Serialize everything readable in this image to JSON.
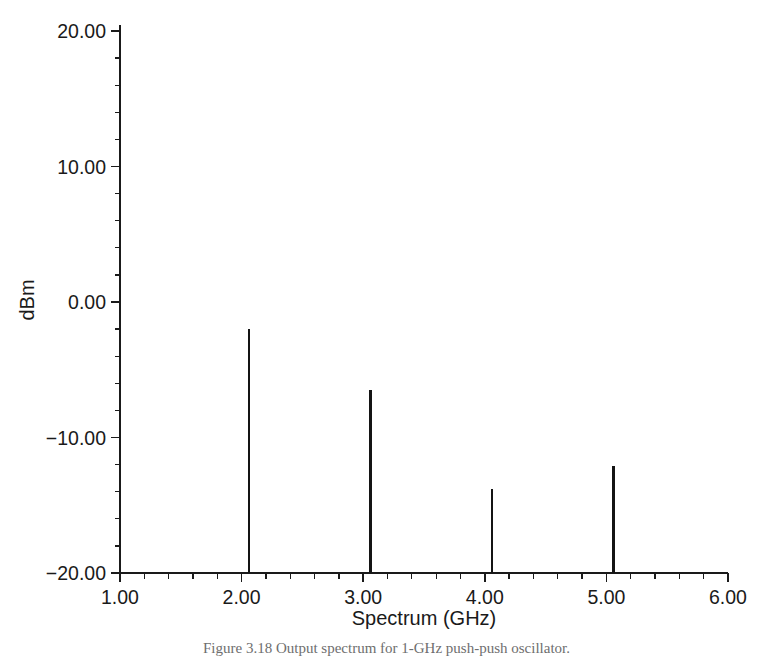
{
  "chart_data": {
    "type": "bar",
    "title": "",
    "subtitle": "",
    "xlabel": "Spectrum (GHz)",
    "ylabel": "dBm",
    "xlim": [
      1.0,
      6.0
    ],
    "ylim": [
      -20.0,
      20.0
    ],
    "grid": false,
    "legend": null,
    "x_tick_labels": [
      "1.00",
      "2.00",
      "3.00",
      "4.00",
      "5.00",
      "6.00"
    ],
    "x_tick_values": [
      1.0,
      2.0,
      3.0,
      4.0,
      5.0,
      6.0
    ],
    "x_minor_ticks_per_interval": 4,
    "y_tick_labels": [
      "20.00",
      "10.00",
      "0.00",
      "-10.00",
      "-20.00"
    ],
    "y_tick_values": [
      20.0,
      10.0,
      0.0,
      -10.0,
      -20.0
    ],
    "y_minor_ticks_per_interval": 4,
    "baseline": -20.0,
    "series": [
      {
        "name": "spectrum",
        "x": [
          2.06,
          3.06,
          4.06,
          5.06
        ],
        "values": [
          -2.0,
          -6.5,
          -13.8,
          -12.1
        ]
      }
    ],
    "points": [
      {
        "label": "fundamental",
        "x": 2.06,
        "y": -2.0
      },
      {
        "label": "harmonic-2",
        "x": 3.06,
        "y": -6.5
      },
      {
        "label": "harmonic-3",
        "x": 4.06,
        "y": -13.8
      },
      {
        "label": "harmonic-4",
        "x": 5.06,
        "y": -12.1
      }
    ],
    "line_color": "#141414",
    "axis_color": "#1a1a1a",
    "background_color": "#ffffff"
  },
  "caption": {
    "text": "Figure 3.18   Output spectrum for 1-GHz push-push oscillator."
  }
}
